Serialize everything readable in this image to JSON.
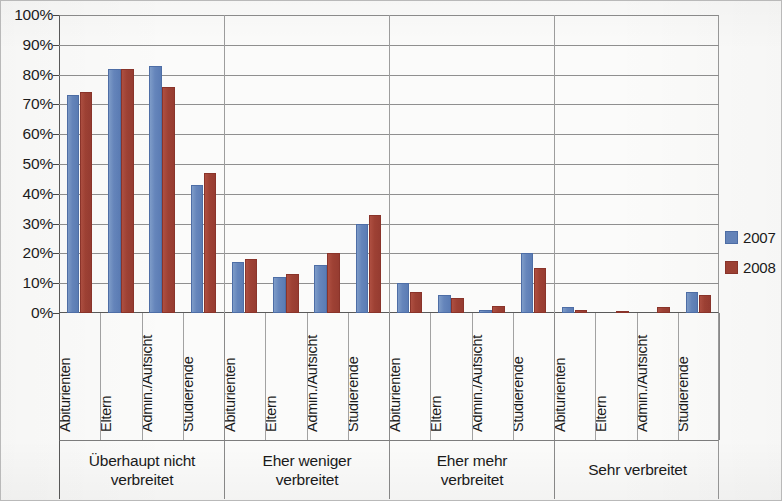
{
  "chart_data": {
    "type": "bar",
    "title": "",
    "xlabel": "",
    "ylabel": "",
    "ylim": [
      0,
      100
    ],
    "ytick_labels": [
      "100%",
      "90%",
      "80%",
      "70%",
      "60%",
      "50%",
      "40%",
      "30%",
      "20%",
      "10%",
      "0%"
    ],
    "ytick_values": [
      100,
      90,
      80,
      70,
      60,
      50,
      40,
      30,
      20,
      10,
      0
    ],
    "grid": true,
    "legend_position": "right",
    "categories": [
      "Abiturienten",
      "Eltern",
      "Admin./Aufsicht",
      "Studierende",
      "Abiturienten",
      "Eltern",
      "Admin./Aufsicht",
      "Studierende",
      "Abiturienten",
      "Eltern",
      "Admin./Aufsicht",
      "Studierende",
      "Abiturienten",
      "Eltern",
      "Admin./Aufsicht",
      "Studierende"
    ],
    "groups": [
      {
        "label": "Überhaupt nicht verbreitet",
        "label_line1": "Überhaupt nicht",
        "label_line2": "verbreitet"
      },
      {
        "label": "Eher weniger verbreitet",
        "label_line1": "Eher weniger",
        "label_line2": "verbreitet"
      },
      {
        "label": "Eher mehr verbreitet",
        "label_line1": "Eher mehr",
        "label_line2": "verbreitet"
      },
      {
        "label": "Sehr verbreitet",
        "label_line1": "Sehr verbreitet",
        "label_line2": ""
      }
    ],
    "series": [
      {
        "name": "2007",
        "color": "#6585bb",
        "values": [
          73,
          82,
          83,
          43,
          17,
          12,
          16,
          30,
          10,
          6,
          1,
          20,
          2,
          0,
          0,
          7
        ]
      },
      {
        "name": "2008",
        "color": "#9e4134",
        "values": [
          74,
          82,
          76,
          47,
          18,
          13,
          20,
          33,
          7,
          5,
          2.5,
          15,
          1,
          0.7,
          2,
          6
        ]
      }
    ]
  },
  "legend": {
    "items": [
      {
        "label": "2007",
        "color": "#6585bb"
      },
      {
        "label": "2008",
        "color": "#9e4134"
      }
    ]
  }
}
